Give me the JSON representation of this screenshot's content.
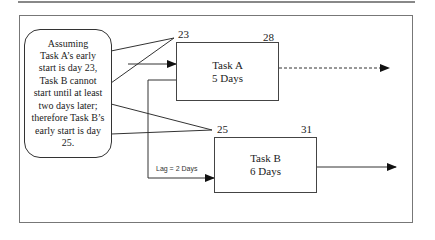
{
  "callout": {
    "lines": [
      "Assuming",
      "Task A’s early",
      "start is day 23,",
      "Task B cannot",
      "start until at least",
      "two days later;",
      "therefore Task B’s",
      "early start is day",
      "25."
    ]
  },
  "task_a": {
    "name": "Task A",
    "duration": "5 Days",
    "early_start": "23",
    "early_finish": "28"
  },
  "task_b": {
    "name": "Task B",
    "duration": "6 Days",
    "early_start": "25",
    "early_finish": "31"
  },
  "lag_label": "Lag = 2 Days",
  "colors": {
    "line": "#333333",
    "frame": "#777777"
  }
}
